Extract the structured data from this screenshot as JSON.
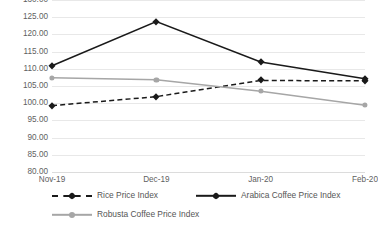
{
  "chart_data": {
    "type": "line",
    "title": "",
    "xlabel": "",
    "ylabel": "",
    "categories": [
      "Nov-19",
      "Dec-19",
      "Jan-20",
      "Feb-20"
    ],
    "ylim": [
      80,
      130
    ],
    "yticks": [
      "80.00",
      "85.00",
      "90.00",
      "95.00",
      "100.00",
      "105.00",
      "110.00",
      "115.00",
      "120.00",
      "125.00",
      "130.00"
    ],
    "ytick_values": [
      80,
      85,
      90,
      95,
      100,
      105,
      110,
      115,
      120,
      125,
      130
    ],
    "grid": "horizontal",
    "legend_position": "bottom",
    "series": [
      {
        "name": "Rice Price Index",
        "values": [
          99.3,
          101.9,
          106.6,
          106.5
        ],
        "color": "#1a1a1a",
        "style": "dashed",
        "marker": "diamond"
      },
      {
        "name": "Arabica Coffee Price Index",
        "values": [
          110.9,
          123.7,
          112.0,
          107.1
        ],
        "color": "#1a1a1a",
        "style": "solid",
        "marker": "diamond"
      },
      {
        "name": "Robusta Coffee Price Index",
        "values": [
          107.4,
          106.8,
          103.5,
          99.4
        ],
        "color": "#a6a6a6",
        "style": "solid",
        "marker": "circle"
      }
    ]
  },
  "axis": {
    "gridline_color": "#e8e8e8",
    "tick_label_color": "#5f5f5f"
  }
}
